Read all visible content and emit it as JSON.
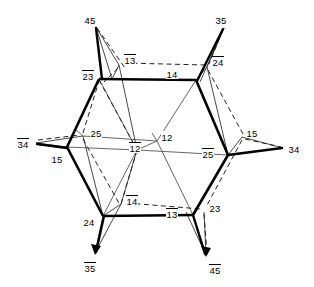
{
  "figure": {
    "type": "labeled-graph-diagram",
    "width": 314,
    "height": 287,
    "background_color": "#ffffff",
    "stroke_color": "#000000"
  },
  "labels": [
    {
      "id": "l-45-topleft",
      "text": "45",
      "bar": false,
      "x": 84,
      "y": 14,
      "anchor": "outer-vertex"
    },
    {
      "id": "l-35-topright",
      "text": "35",
      "bar": false,
      "x": 215,
      "y": 14,
      "anchor": "outer-vertex"
    },
    {
      "id": "l-13-top",
      "text": "13",
      "bar": true,
      "x": 124,
      "y": 54,
      "anchor": "inner-node"
    },
    {
      "id": "l-24-topright",
      "text": "24",
      "bar": true,
      "x": 212,
      "y": 56,
      "anchor": "inner-node"
    },
    {
      "id": "l-23-upperleft",
      "text": "23",
      "bar": true,
      "x": 82,
      "y": 70,
      "anchor": "hex-vertex"
    },
    {
      "id": "l-14-top",
      "text": "14",
      "bar": false,
      "x": 166,
      "y": 68,
      "anchor": "hex-edge"
    },
    {
      "id": "l-34-left",
      "text": "34",
      "bar": true,
      "x": 17,
      "y": 138,
      "anchor": "outer-vertex"
    },
    {
      "id": "l-25-left",
      "text": "25",
      "bar": false,
      "x": 90,
      "y": 127,
      "anchor": "inner-node"
    },
    {
      "id": "l-12-center",
      "text": "12",
      "bar": false,
      "x": 161,
      "y": 131,
      "anchor": "inner-node"
    },
    {
      "id": "l-15-right",
      "text": "15",
      "bar": false,
      "x": 246,
      "y": 127,
      "anchor": "inner-node"
    },
    {
      "id": "l-15-leftvertex",
      "text": "15",
      "bar": false,
      "x": 51,
      "y": 153,
      "anchor": "hex-vertex"
    },
    {
      "id": "l-12-centerbar",
      "text": "12",
      "bar": true,
      "x": 129,
      "y": 142,
      "anchor": "inner-node"
    },
    {
      "id": "l-25-rightvertex",
      "text": "25",
      "bar": true,
      "x": 202,
      "y": 148,
      "anchor": "hex-vertex"
    },
    {
      "id": "l-34-right",
      "text": "34",
      "bar": false,
      "x": 288,
      "y": 143,
      "anchor": "outer-vertex"
    },
    {
      "id": "l-14-bottom",
      "text": "14",
      "bar": true,
      "x": 126,
      "y": 195,
      "anchor": "inner-node"
    },
    {
      "id": "l-13-bottom",
      "text": "13",
      "bar": true,
      "x": 166,
      "y": 208,
      "anchor": "hex-edge"
    },
    {
      "id": "l-23-bottomright",
      "text": "23",
      "bar": false,
      "x": 209,
      "y": 202,
      "anchor": "inner-node"
    },
    {
      "id": "l-24-bottomleft",
      "text": "24",
      "bar": false,
      "x": 83,
      "y": 216,
      "anchor": "hex-vertex"
    },
    {
      "id": "l-35-bottom",
      "text": "35",
      "bar": true,
      "x": 84,
      "y": 262,
      "anchor": "outer-vertex"
    },
    {
      "id": "l-45-bottomright",
      "text": "45",
      "bar": true,
      "x": 209,
      "y": 264,
      "anchor": "outer-vertex"
    }
  ],
  "geometry": {
    "hexagon": [
      {
        "name": "hex-top-left",
        "x": 99,
        "y": 79
      },
      {
        "name": "hex-top-right",
        "x": 196,
        "y": 80
      },
      {
        "name": "hex-right",
        "x": 228,
        "y": 155
      },
      {
        "name": "hex-bottom-right",
        "x": 193,
        "y": 215
      },
      {
        "name": "hex-bottom-left",
        "x": 103,
        "y": 216
      },
      {
        "name": "hex-left",
        "x": 67,
        "y": 147
      }
    ],
    "outer_points": [
      {
        "name": "pt-45-topleft",
        "x": 96,
        "y": 27
      },
      {
        "name": "pt-35-topright",
        "x": 224,
        "y": 28
      },
      {
        "name": "pt-34-left",
        "x": 36,
        "y": 143
      },
      {
        "name": "pt-34-right",
        "x": 283,
        "y": 148
      },
      {
        "name": "pt-35-bottom",
        "x": 95,
        "y": 253
      },
      {
        "name": "pt-45-bottomright",
        "x": 206,
        "y": 255
      }
    ],
    "inner_nodes": [
      {
        "name": "node-13-top",
        "x": 119,
        "y": 65
      },
      {
        "name": "node-24-topright",
        "x": 207,
        "y": 67
      },
      {
        "name": "node-25-left",
        "x": 83,
        "y": 136
      },
      {
        "name": "node-12-right",
        "x": 157,
        "y": 141
      },
      {
        "name": "node-12-left",
        "x": 137,
        "y": 150
      },
      {
        "name": "node-15-right",
        "x": 242,
        "y": 137
      },
      {
        "name": "node-14-bottom",
        "x": 121,
        "y": 204
      },
      {
        "name": "node-23-bottom",
        "x": 204,
        "y": 212
      }
    ]
  }
}
